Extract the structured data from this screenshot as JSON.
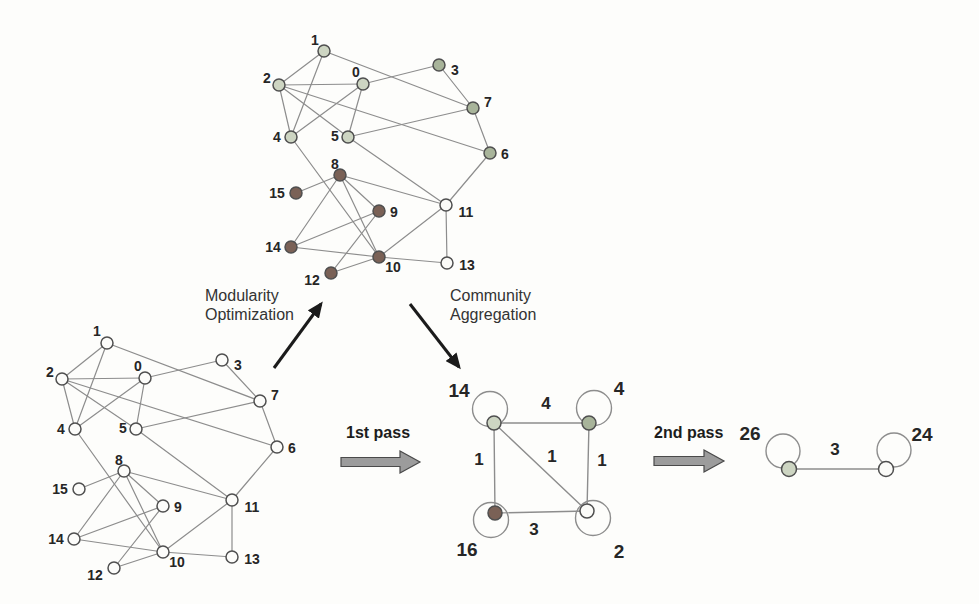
{
  "figure": {
    "texts": {
      "modularity": {
        "label": "Modularity\nOptimization"
      },
      "aggregation": {
        "label": "Community\nAggregation"
      },
      "pass1": {
        "label": "1st pass"
      },
      "pass2": {
        "label": "2nd pass"
      }
    },
    "colors": {
      "background": "#fdfdfb",
      "edge": "#8d8d8d",
      "node_stroke": "#4f4f4f",
      "text": "#262626",
      "thick_arrow_fill": "#9c9c9c",
      "thick_arrow_stroke": "#4a4a4a",
      "thin_arrow": "#1b1b1b",
      "palette": {
        "A": "#cdd5c2",
        "B": "#a8b49a",
        "C": "#7a6156",
        "D": "#fbfbf8",
        "plain": "#fcfcfa"
      }
    },
    "graphs": [
      {
        "id": "optimized-graph",
        "node_r": 6,
        "edge_width": 1.2,
        "label_size": 14,
        "label_weight": 600,
        "weight_size": 16,
        "nodes": [
          {
            "id": "1",
            "x": 324,
            "y": 51,
            "c": "A",
            "lx": -9,
            "ly": -11
          },
          {
            "id": "2",
            "x": 279,
            "y": 85,
            "c": "A",
            "lx": -12,
            "ly": -7
          },
          {
            "id": "0",
            "x": 363,
            "y": 84,
            "c": "A",
            "lx": -7,
            "ly": -12
          },
          {
            "id": "3",
            "x": 439,
            "y": 65,
            "c": "B",
            "lx": 16,
            "ly": 5
          },
          {
            "id": "7",
            "x": 473,
            "y": 108,
            "c": "B",
            "lx": 15,
            "ly": -6
          },
          {
            "id": "4",
            "x": 291,
            "y": 137,
            "c": "A",
            "lx": -14,
            "ly": 0
          },
          {
            "id": "5",
            "x": 348,
            "y": 137,
            "c": "A",
            "lx": -13,
            "ly": -1
          },
          {
            "id": "6",
            "x": 490,
            "y": 153,
            "c": "B",
            "lx": 15,
            "ly": 1
          },
          {
            "id": "8",
            "x": 340,
            "y": 175,
            "c": "C",
            "lx": -5,
            "ly": -11
          },
          {
            "id": "15",
            "x": 296,
            "y": 193,
            "c": "C",
            "lx": -19,
            "ly": 0
          },
          {
            "id": "9",
            "x": 379,
            "y": 211,
            "c": "C",
            "lx": 15,
            "ly": 1
          },
          {
            "id": "11",
            "x": 446,
            "y": 205,
            "c": "D",
            "lx": 20,
            "ly": 7
          },
          {
            "id": "14",
            "x": 291,
            "y": 247,
            "c": "C",
            "lx": -18,
            "ly": 0
          },
          {
            "id": "10",
            "x": 379,
            "y": 257,
            "c": "C",
            "lx": 14,
            "ly": 10
          },
          {
            "id": "13",
            "x": 447,
            "y": 263,
            "c": "D",
            "lx": 20,
            "ly": 2
          },
          {
            "id": "12",
            "x": 331,
            "y": 273,
            "c": "C",
            "lx": -19,
            "ly": 7
          }
        ],
        "edges": [
          {
            "a": "0",
            "b": "2"
          },
          {
            "a": "0",
            "b": "3"
          },
          {
            "a": "0",
            "b": "4"
          },
          {
            "a": "0",
            "b": "5"
          },
          {
            "a": "1",
            "b": "2"
          },
          {
            "a": "1",
            "b": "4"
          },
          {
            "a": "1",
            "b": "7"
          },
          {
            "a": "2",
            "b": "4"
          },
          {
            "a": "2",
            "b": "5"
          },
          {
            "a": "2",
            "b": "6"
          },
          {
            "a": "3",
            "b": "7"
          },
          {
            "a": "4",
            "b": "10"
          },
          {
            "a": "5",
            "b": "7"
          },
          {
            "a": "5",
            "b": "11"
          },
          {
            "a": "6",
            "b": "7"
          },
          {
            "a": "6",
            "b": "11"
          },
          {
            "a": "8",
            "b": "9"
          },
          {
            "a": "8",
            "b": "10"
          },
          {
            "a": "8",
            "b": "11"
          },
          {
            "a": "8",
            "b": "14"
          },
          {
            "a": "8",
            "b": "15"
          },
          {
            "a": "9",
            "b": "12"
          },
          {
            "a": "9",
            "b": "14"
          },
          {
            "a": "10",
            "b": "11"
          },
          {
            "a": "10",
            "b": "12"
          },
          {
            "a": "10",
            "b": "13"
          },
          {
            "a": "10",
            "b": "14"
          },
          {
            "a": "11",
            "b": "13"
          }
        ]
      },
      {
        "id": "original-graph",
        "node_r": 6,
        "edge_width": 1.2,
        "label_size": 14,
        "label_weight": 600,
        "weight_size": 16,
        "nodes": [
          {
            "id": "1",
            "x": 107,
            "y": 343,
            "c": "plain",
            "lx": -10,
            "ly": -12
          },
          {
            "id": "2",
            "x": 62,
            "y": 379,
            "c": "plain",
            "lx": -12,
            "ly": -7
          },
          {
            "id": "0",
            "x": 145,
            "y": 378,
            "c": "plain",
            "lx": -7,
            "ly": -12
          },
          {
            "id": "3",
            "x": 222,
            "y": 360,
            "c": "plain",
            "lx": 16,
            "ly": 5
          },
          {
            "id": "7",
            "x": 260,
            "y": 401,
            "c": "plain",
            "lx": 15,
            "ly": -6
          },
          {
            "id": "4",
            "x": 75,
            "y": 429,
            "c": "plain",
            "lx": -14,
            "ly": 0
          },
          {
            "id": "5",
            "x": 136,
            "y": 429,
            "c": "plain",
            "lx": -13,
            "ly": -1
          },
          {
            "id": "6",
            "x": 277,
            "y": 447,
            "c": "plain",
            "lx": 15,
            "ly": 1
          },
          {
            "id": "8",
            "x": 124,
            "y": 471,
            "c": "plain",
            "lx": -5,
            "ly": -11
          },
          {
            "id": "15",
            "x": 79,
            "y": 489,
            "c": "plain",
            "lx": -19,
            "ly": 0
          },
          {
            "id": "9",
            "x": 163,
            "y": 506,
            "c": "plain",
            "lx": 15,
            "ly": 1
          },
          {
            "id": "11",
            "x": 232,
            "y": 500,
            "c": "plain",
            "lx": 20,
            "ly": 7
          },
          {
            "id": "14",
            "x": 74,
            "y": 539,
            "c": "plain",
            "lx": -18,
            "ly": 0
          },
          {
            "id": "10",
            "x": 163,
            "y": 552,
            "c": "plain",
            "lx": 14,
            "ly": 10
          },
          {
            "id": "13",
            "x": 232,
            "y": 557,
            "c": "plain",
            "lx": 20,
            "ly": 2
          },
          {
            "id": "12",
            "x": 114,
            "y": 568,
            "c": "plain",
            "lx": -19,
            "ly": 7
          }
        ],
        "edges": [
          {
            "a": "0",
            "b": "2"
          },
          {
            "a": "0",
            "b": "3"
          },
          {
            "a": "0",
            "b": "4"
          },
          {
            "a": "0",
            "b": "5"
          },
          {
            "a": "1",
            "b": "2"
          },
          {
            "a": "1",
            "b": "4"
          },
          {
            "a": "1",
            "b": "7"
          },
          {
            "a": "2",
            "b": "4"
          },
          {
            "a": "2",
            "b": "5"
          },
          {
            "a": "2",
            "b": "6"
          },
          {
            "a": "3",
            "b": "7"
          },
          {
            "a": "4",
            "b": "10"
          },
          {
            "a": "5",
            "b": "7"
          },
          {
            "a": "5",
            "b": "11"
          },
          {
            "a": "6",
            "b": "7"
          },
          {
            "a": "6",
            "b": "11"
          },
          {
            "a": "8",
            "b": "9"
          },
          {
            "a": "8",
            "b": "10"
          },
          {
            "a": "8",
            "b": "11"
          },
          {
            "a": "8",
            "b": "14"
          },
          {
            "a": "8",
            "b": "15"
          },
          {
            "a": "9",
            "b": "12"
          },
          {
            "a": "9",
            "b": "14"
          },
          {
            "a": "10",
            "b": "11"
          },
          {
            "a": "10",
            "b": "12"
          },
          {
            "a": "10",
            "b": "13"
          },
          {
            "a": "10",
            "b": "14"
          },
          {
            "a": "11",
            "b": "13"
          }
        ]
      },
      {
        "id": "aggregated-graph-pass1",
        "node_r": 7,
        "edge_width": 1.4,
        "label_size": 19,
        "label_weight": 700,
        "weight_size": 17,
        "nodes": [
          {
            "id": "c14",
            "label": "14",
            "x": 494,
            "y": 423,
            "c": "A",
            "lx": -35,
            "ly": -33,
            "loop": {
              "dx": -4,
              "dy": -14,
              "r": 17.5
            }
          },
          {
            "id": "c4",
            "label": "4",
            "x": 589,
            "y": 423,
            "c": "B",
            "lx": 30,
            "ly": -35,
            "loop": {
              "dx": 5,
              "dy": -15,
              "r": 17.5
            }
          },
          {
            "id": "c16",
            "label": "16",
            "x": 495,
            "y": 513,
            "c": "C",
            "lx": -28,
            "ly": 36,
            "loop": {
              "dx": -4,
              "dy": 7,
              "r": 17.5
            }
          },
          {
            "id": "c2",
            "label": "2",
            "x": 587,
            "y": 511,
            "c": "D",
            "lx": 32,
            "ly": 40,
            "loop": {
              "dx": 6,
              "dy": 7,
              "r": 17.5
            }
          }
        ],
        "edges": [
          {
            "a": "c14",
            "b": "c4",
            "w": "4",
            "wx": 546,
            "wy": 403
          },
          {
            "a": "c14",
            "b": "c16",
            "w": "1",
            "wx": 479,
            "wy": 459
          },
          {
            "a": "c14",
            "b": "c2",
            "w": "1",
            "wx": 552,
            "wy": 456
          },
          {
            "a": "c4",
            "b": "c2",
            "w": "1",
            "wx": 602,
            "wy": 460
          },
          {
            "a": "c16",
            "b": "c2",
            "w": "3",
            "wx": 534,
            "wy": 529
          }
        ]
      },
      {
        "id": "aggregated-graph-pass2",
        "node_r": 7.5,
        "edge_width": 1.4,
        "label_size": 19,
        "label_weight": 700,
        "weight_size": 17,
        "nodes": [
          {
            "id": "c26",
            "label": "26",
            "x": 789,
            "y": 469,
            "c": "A",
            "lx": -39,
            "ly": -36,
            "loop": {
              "dx": -6,
              "dy": -18,
              "r": 17
            }
          },
          {
            "id": "c24",
            "label": "24",
            "x": 886,
            "y": 469,
            "c": "D",
            "lx": 36,
            "ly": -35,
            "loop": {
              "dx": 8,
              "dy": -19,
              "r": 17
            }
          }
        ],
        "edges": [
          {
            "a": "c26",
            "b": "c24",
            "w": "3",
            "wx": 835,
            "wy": 449
          }
        ]
      }
    ],
    "arrows": [
      {
        "name": "modularity-optimization-arrow",
        "type": "thin",
        "x1": 274,
        "y1": 368,
        "x2": 321,
        "y2": 304
      },
      {
        "name": "community-aggregation-arrow",
        "type": "thin",
        "x1": 410,
        "y1": 304,
        "x2": 459,
        "y2": 367
      },
      {
        "name": "pass1-arrow",
        "type": "thick",
        "x1": 341,
        "y1": 462,
        "x2": 420,
        "y2": 462
      },
      {
        "name": "pass2-arrow",
        "type": "thick",
        "x1": 654,
        "y1": 461,
        "x2": 724,
        "y2": 461
      }
    ]
  }
}
